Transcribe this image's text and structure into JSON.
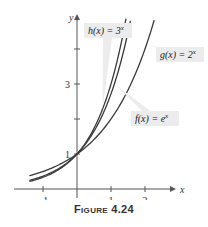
{
  "caption": "Figure 4.24",
  "chart_data": {
    "type": "line",
    "title": "",
    "xlabel": "x",
    "ylabel": "y",
    "xlim": [
      -1.4,
      2.8
    ],
    "ylim": [
      -0.3,
      4.85
    ],
    "x_ticks": [
      -1,
      1,
      2
    ],
    "x_tick_labels": [
      "−1",
      "1",
      "2"
    ],
    "y_ticks": [
      1,
      2,
      3,
      4
    ],
    "y_tick_labels": [
      "1",
      "",
      "3",
      ""
    ],
    "grid": false,
    "series": [
      {
        "name": "h(x) = 3^x",
        "label": "h(x) = 3",
        "exp": "x",
        "base": 3,
        "x_range": [
          -1.4,
          1.44
        ]
      },
      {
        "name": "f(x) = e^x",
        "label": "f(x) = e",
        "exp": "x",
        "base": 2.71828,
        "x_range": [
          -1.4,
          1.57
        ]
      },
      {
        "name": "g(x) = 2^x",
        "label": "g(x) = 2",
        "exp": "x",
        "base": 2,
        "x_range": [
          -1.4,
          2.27
        ]
      }
    ],
    "annotations": [
      {
        "text": "h(x) = 3^x",
        "box_x": 84,
        "box_y": 23,
        "points_to_x": 0.75
      },
      {
        "text": "g(x) = 2^x",
        "box_x": 156,
        "box_y": 47,
        "points_to_x": 2.05
      },
      {
        "text": "f(x) = e^x",
        "box_x": 131,
        "box_y": 111,
        "points_to_x": 1.1
      }
    ],
    "colors": {
      "curve": "#3a3a3a",
      "axis": "#555555",
      "label_bg": "#ececec"
    }
  }
}
